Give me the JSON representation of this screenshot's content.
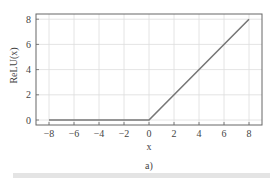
{
  "chart_data": {
    "type": "line",
    "title": "",
    "xlabel": "x",
    "ylabel": "ReLU(x)",
    "xlim": [
      -9,
      9.1
    ],
    "ylim": [
      -0.4,
      8.4
    ],
    "x_ticks": [
      -8,
      -6,
      -4,
      -2,
      0,
      2,
      4,
      6,
      8
    ],
    "y_ticks": [
      0,
      2,
      4,
      6,
      8
    ],
    "grid": true,
    "legend": null,
    "series": [
      {
        "name": "ReLU(x)",
        "color": "#777777",
        "x": [
          -8,
          0,
          8
        ],
        "y": [
          0,
          0,
          8
        ]
      }
    ]
  },
  "caption": "a)",
  "colors": {
    "grid": "#dddddd",
    "frame": "#666666",
    "line": "#777777",
    "footer_bar": "#e4e4e4"
  }
}
